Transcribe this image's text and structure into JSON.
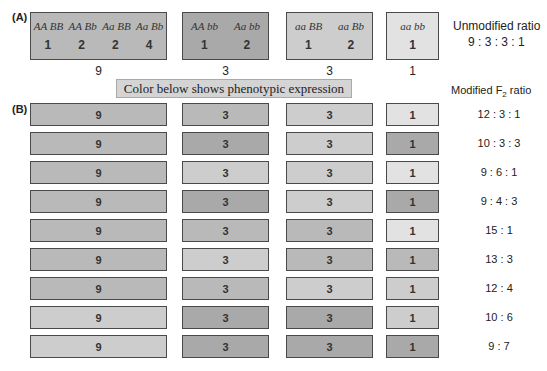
{
  "colors": {
    "dark": "#a9a9a9",
    "mid": "#b9b9b9",
    "light": "#cdcdcd",
    "verylight": "#e2e2e2",
    "banner": "#d4d4d4"
  },
  "panel_a": {
    "label": "(A)",
    "groups": [
      {
        "genotypes": [
          "AA BB",
          "AA Bb",
          "Aa BB",
          "Aa Bb"
        ],
        "counts": [
          "1",
          "2",
          "2",
          "4"
        ],
        "total": "9",
        "shade": "mid"
      },
      {
        "genotypes": [
          "AA bb",
          "Aa bb"
        ],
        "counts": [
          "1",
          "2"
        ],
        "total": "3",
        "shade": "dark"
      },
      {
        "genotypes": [
          "aa BB",
          "aa Bb"
        ],
        "counts": [
          "1",
          "2"
        ],
        "total": "3",
        "shade": "light"
      },
      {
        "genotypes": [
          "aa bb"
        ],
        "counts": [
          "1"
        ],
        "total": "1",
        "shade": "verylight"
      }
    ],
    "ratio_title": "Unmodified ratio",
    "ratio_value": "9 : 3 : 3 : 1"
  },
  "banner": "Color below shows phenotypic expression",
  "panel_b": {
    "label": "(B)",
    "ratio_title_prefix": "Modified F",
    "ratio_title_sub": "2",
    "ratio_title_suffix": " ratio",
    "box_values": [
      "9",
      "3",
      "3",
      "1"
    ],
    "rows": [
      {
        "ratio": "12 : 3 : 1",
        "shades": [
          "mid",
          "mid",
          "light",
          "verylight"
        ]
      },
      {
        "ratio": "10 : 3 : 3",
        "shades": [
          "mid",
          "dark",
          "light",
          "dark"
        ]
      },
      {
        "ratio": "9 : 6 : 1",
        "shades": [
          "mid",
          "light",
          "light",
          "verylight"
        ]
      },
      {
        "ratio": "9 : 4 : 3",
        "shades": [
          "mid",
          "dark",
          "light",
          "dark"
        ]
      },
      {
        "ratio": "15 : 1",
        "shades": [
          "mid",
          "mid",
          "mid",
          "verylight"
        ]
      },
      {
        "ratio": "13 : 3",
        "shades": [
          "mid",
          "light",
          "mid",
          "mid"
        ]
      },
      {
        "ratio": "12 : 4",
        "shades": [
          "mid",
          "mid",
          "light",
          "light"
        ]
      },
      {
        "ratio": "10 : 6",
        "shades": [
          "light",
          "dark",
          "dark",
          "light"
        ]
      },
      {
        "ratio": "9 : 7",
        "shades": [
          "light",
          "dark",
          "dark",
          "dark"
        ]
      }
    ]
  }
}
